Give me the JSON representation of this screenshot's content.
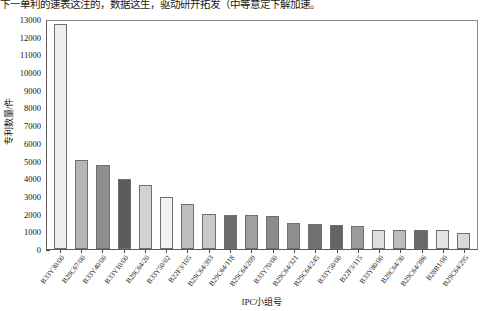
{
  "caption": "下一单利的速表这注的，数据这生，驱动研开拓发（中等意定下解加速。",
  "chart_data": {
    "type": "bar",
    "title": "",
    "xlabel": "IPC小组号",
    "ylabel": "专利数量/件",
    "ylim": [
      0,
      13000
    ],
    "ystep": 1000,
    "grid": false,
    "legend": "none",
    "ytick_labels": [
      "13000",
      "12000",
      "11000",
      "10000",
      "9000",
      "8000",
      "7000",
      "6000",
      "5000",
      "4000",
      "3000",
      "2000",
      "1000",
      "0"
    ],
    "categories": [
      "B33Y30/00",
      "B29C67/00",
      "B33Y40/00",
      "B33Y10/00",
      "B29C64/20",
      "B33Y50/02",
      "B22F3/105",
      "B29C64/393",
      "B29C64/118",
      "B29C64/209",
      "B33Y70/00",
      "B29C64/321",
      "B29C64/245",
      "B33Y50/00",
      "B22F3/115",
      "B33Y80/00",
      "B29C64/30",
      "B29C64/386",
      "B28B1/00",
      "B29C64/295"
    ],
    "values": [
      12700,
      5050,
      4750,
      3950,
      3600,
      2950,
      2550,
      2000,
      1950,
      1900,
      1850,
      1450,
      1400,
      1350,
      1300,
      1100,
      1090,
      1080,
      1050,
      900
    ],
    "bar_colors": [
      "#efefef",
      "#b5b5b5",
      "#8f8f8f",
      "#5a5a5a",
      "#d2d2d2",
      "#f2f2f2",
      "#bfbfbf",
      "#c9c9c9",
      "#6d6d6d",
      "#a0a0a0",
      "#8b8b8b",
      "#8f8f8f",
      "#707070",
      "#646464",
      "#9b9b9b",
      "#dedede",
      "#bcbcbc",
      "#6a6a6a",
      "#e4e4e4",
      "#d9d9d9"
    ]
  }
}
